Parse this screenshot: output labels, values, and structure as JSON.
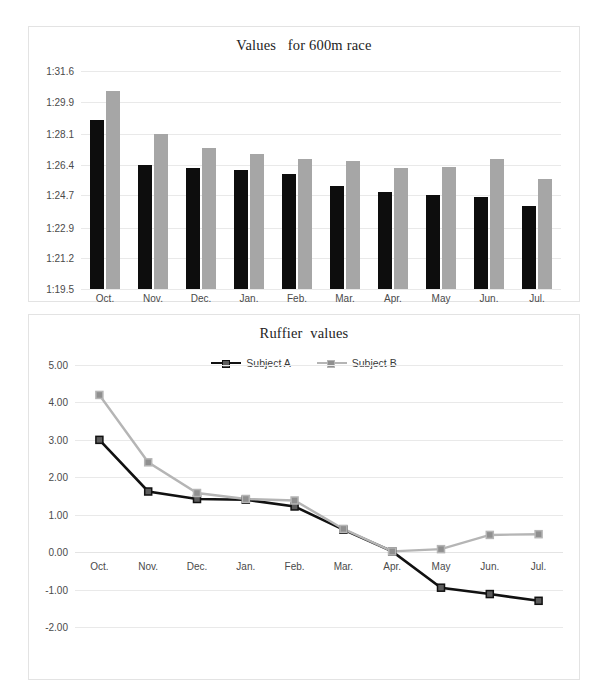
{
  "chart_data": [
    {
      "type": "bar",
      "title": "Values   for 600m race",
      "xlabel": "",
      "ylabel": "",
      "grid": true,
      "legend": "none",
      "categories": [
        "Oct.",
        "Nov.",
        "Dec.",
        "Jan.",
        "Feb.",
        "Mar.",
        "Apr.",
        "May",
        "Jun.",
        "Jul."
      ],
      "ytick_labels": [
        "1:31.6",
        "1:29.9",
        "1:28.1",
        "1:26.4",
        "1:24.7",
        "1:22.9",
        "1:21.2",
        "1:19.5"
      ],
      "ytick_values": [
        31.6,
        29.9,
        28.1,
        26.4,
        24.7,
        22.9,
        21.2,
        19.5
      ],
      "ylim": [
        19.5,
        31.6
      ],
      "series": [
        {
          "name": "Subject A",
          "color": "#0d0d0d",
          "value_labels": [
            "1:28.9",
            "1:26.4",
            "1:26.2",
            "1:26.1",
            "1:25.9",
            "1:25.2",
            "1:24.9",
            "1:24.7",
            "1:24.6",
            "1:24.1"
          ],
          "values": [
            28.9,
            26.4,
            26.2,
            26.1,
            25.9,
            25.2,
            24.9,
            24.7,
            24.6,
            24.1
          ]
        },
        {
          "name": "Subject B",
          "color": "#a6a6a6",
          "value_labels": [
            "1:30.5",
            "1:28.1",
            "1:27.3",
            "1:27.0",
            "1:26.7",
            "1:26.6",
            "1:26.2",
            "1:26.3",
            "1:26.7",
            "1:25.6"
          ],
          "values": [
            30.5,
            28.1,
            27.3,
            27.0,
            26.7,
            26.6,
            26.2,
            26.3,
            26.7,
            25.6
          ]
        }
      ]
    },
    {
      "type": "line",
      "title": "Ruffier  values",
      "xlabel": "",
      "ylabel": "",
      "grid": true,
      "legend": "top-right",
      "categories": [
        "Oct.",
        "Nov.",
        "Dec.",
        "Jan.",
        "Feb.",
        "Mar.",
        "Apr.",
        "May",
        "Jun.",
        "Jul."
      ],
      "ytick_labels": [
        "5.00",
        "4.00",
        "3.00",
        "2.00",
        "1.00",
        "0.00",
        "-1.00",
        "-2.00"
      ],
      "ytick_values": [
        5,
        4,
        3,
        2,
        1,
        0,
        -1,
        -2
      ],
      "ylim": [
        -2,
        5
      ],
      "series": [
        {
          "name": "Subject A",
          "color": "#111111",
          "marker_fill": "#5c5c5c",
          "values": [
            3.0,
            1.62,
            1.42,
            1.4,
            1.22,
            0.6,
            0.02,
            -0.95,
            -1.12,
            -1.3
          ]
        },
        {
          "name": "Subject B",
          "color": "#b5b5b5",
          "marker_fill": "#8f8f8f",
          "values": [
            4.2,
            2.4,
            1.58,
            1.42,
            1.38,
            0.62,
            0.02,
            0.08,
            0.46,
            0.48
          ]
        }
      ]
    }
  ]
}
